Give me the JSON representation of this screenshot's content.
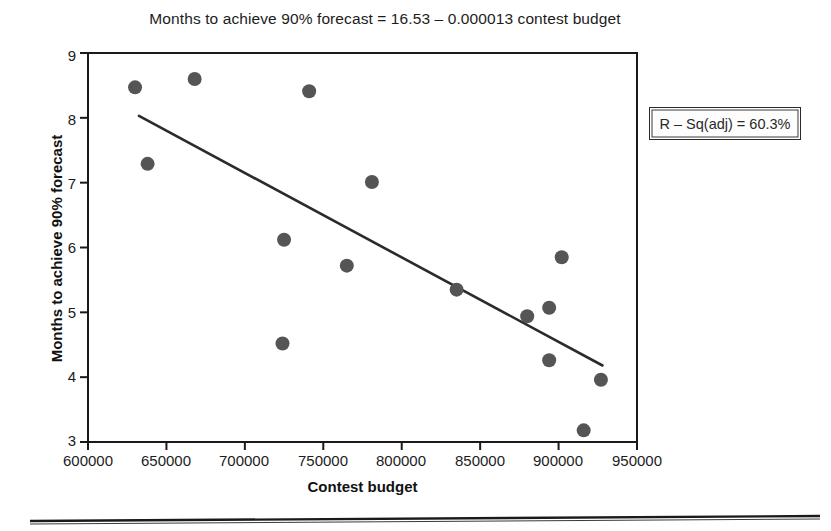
{
  "chart_data": {
    "type": "scatter",
    "title": "Months to achieve 90% forecast = 16.53 – 0.000013 contest budget",
    "xlabel": "Contest budget",
    "ylabel": "Months to achieve 90% forecast",
    "xlim": [
      600000,
      950000
    ],
    "ylim": [
      3,
      9
    ],
    "grid": false,
    "legend_position": "none",
    "xticks": [
      "600000",
      "650000",
      "700000",
      "750000",
      "800000",
      "850000",
      "900000",
      "950000"
    ],
    "xtick_values": [
      600000,
      650000,
      700000,
      750000,
      800000,
      850000,
      900000,
      950000
    ],
    "yticks": [
      "9",
      "8",
      "7",
      "6",
      "5",
      "4",
      "3"
    ],
    "ytick_values": [
      9,
      8,
      7,
      6,
      5,
      4,
      3
    ],
    "marker_color": "#555555",
    "line_color": "#2b2b2b",
    "axis_color": "#1a1a1a",
    "points": [
      {
        "x": 630000,
        "y": 8.47
      },
      {
        "x": 668000,
        "y": 8.6
      },
      {
        "x": 638000,
        "y": 7.29
      },
      {
        "x": 741000,
        "y": 8.41
      },
      {
        "x": 781000,
        "y": 7.01
      },
      {
        "x": 725000,
        "y": 6.12
      },
      {
        "x": 765000,
        "y": 5.72
      },
      {
        "x": 724000,
        "y": 4.52
      },
      {
        "x": 835000,
        "y": 5.35
      },
      {
        "x": 880000,
        "y": 4.94
      },
      {
        "x": 894000,
        "y": 5.07
      },
      {
        "x": 902000,
        "y": 5.85
      },
      {
        "x": 894000,
        "y": 4.26
      },
      {
        "x": 927000,
        "y": 3.96
      },
      {
        "x": 916000,
        "y": 3.18
      }
    ],
    "fit_line": {
      "equation": "Months to achieve 90% forecast = 16.53 – 0.000013 contest budget",
      "intercept": 16.53,
      "slope": -1.3e-05,
      "x_start": 632500,
      "x_end": 928000,
      "y_start": 8.03,
      "y_end": 4.18
    },
    "annotations": [
      {
        "name": "r-squared-adjusted",
        "text": "R – Sq(adj) = 60.3%",
        "value": 60.3
      }
    ]
  }
}
